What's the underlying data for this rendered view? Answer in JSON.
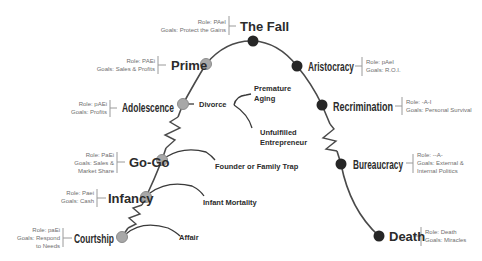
{
  "diagram": {
    "colors": {
      "curve": "#4a4a4a",
      "growth_node": "#a8a8a8",
      "growth_node_stroke": "#8c8c8c",
      "aging_node": "#262626",
      "stage_text": "#2b2b2b",
      "meta_text": "#6e6e6e",
      "bracket": "#9a9a9a"
    },
    "stages": [
      {
        "id": "courtship",
        "name": "Courtship",
        "phase": "growth",
        "role": "Role: paEi",
        "goals": [
          "Goals: Respond",
          "to Needs"
        ]
      },
      {
        "id": "infancy",
        "name": "Infancy",
        "phase": "growth",
        "role": "Role: Paei",
        "goals": [
          "Goals: Cash"
        ]
      },
      {
        "id": "go-go",
        "name": "Go-Go",
        "phase": "growth",
        "role": "Role: PaEi",
        "goals": [
          "Goals: Sales &",
          "Market Share"
        ]
      },
      {
        "id": "adolescence",
        "name": "Adolescence",
        "phase": "growth",
        "role": "Role: pAEi",
        "goals": [
          "Goals: Profits"
        ]
      },
      {
        "id": "prime",
        "name": "Prime",
        "phase": "growth",
        "role": "Role: PAEi",
        "goals": [
          "Goals: Sales & Profits"
        ]
      },
      {
        "id": "the-fall",
        "name": "The Fall",
        "phase": "aging",
        "role": "Role: PAeI",
        "goals": [
          "Goals: Protect the Gains"
        ]
      },
      {
        "id": "aristocracy",
        "name": "Aristocracy",
        "phase": "aging",
        "role": "Role: pAeI",
        "goals": [
          "Goals: R.O.I."
        ]
      },
      {
        "id": "recrimination",
        "name": "Recrimination",
        "phase": "aging",
        "role": "Role: -A-I",
        "goals": [
          "Goals: Personal Survival"
        ]
      },
      {
        "id": "bureaucracy",
        "name": "Bureaucracy",
        "phase": "aging",
        "role": "Role: --A-",
        "goals": [
          "Goals: External &",
          "Internal Politics"
        ]
      },
      {
        "id": "death",
        "name": "Death",
        "phase": "aging",
        "role": "Role: Death",
        "goals": [
          "Goals: Miracles"
        ]
      }
    ],
    "traps": {
      "affair": "Affair",
      "infant_mortality": "Infant Mortality",
      "founder_trap": "Founder or Family Trap",
      "divorce": "Divorce",
      "premature_aging": [
        "Premature",
        "Aging"
      ],
      "unfulfilled_entrepreneur": [
        "Unfulfilled",
        "Entrepreneur"
      ]
    }
  }
}
